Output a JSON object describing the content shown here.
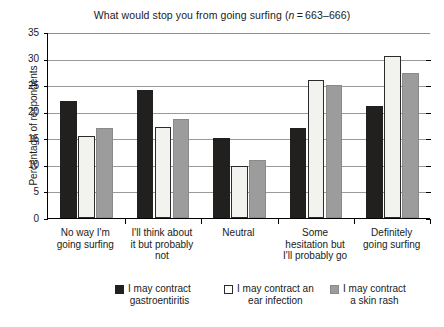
{
  "chart_data": {
    "type": "bar",
    "title_plain": "What would stop you from going surfing (n=663–666)",
    "title_prefix": "What would stop you from going surfing (",
    "title_italic": "n",
    "title_suffix": " = 663–666)",
    "xlabel": "",
    "ylabel": "Percentage of respondents",
    "ylim": [
      0,
      35
    ],
    "ytick_step": 5,
    "yticks": [
      0,
      5,
      10,
      15,
      20,
      25,
      30,
      35
    ],
    "ytick_labels": [
      "0",
      "5",
      "10",
      "15",
      "20",
      "25",
      "30",
      "35"
    ],
    "grid": true,
    "grid_axis": "y",
    "legend_position": "bottom",
    "categories": [
      "No way I'm going surfing",
      "I'll think about it but probably not",
      "Neutral",
      "Some hesitation but I'll probably go",
      "Definitely going surfing"
    ],
    "category_lines": [
      [
        "No way I'm",
        "going surfing"
      ],
      [
        "I'll think about",
        "it but probably",
        "not"
      ],
      [
        "Neutral"
      ],
      [
        "Some",
        "hesitation but",
        "I'll probably go"
      ],
      [
        "Definitely",
        "going surfing"
      ]
    ],
    "series": [
      {
        "name": "I may contract gastroentiritis",
        "name_lines": [
          "I may contract",
          "gastroentiritis"
        ],
        "color": "#221f1f",
        "swatch": "black",
        "values": [
          22,
          24,
          15,
          17,
          21
        ]
      },
      {
        "name": "I may contract an ear infection",
        "name_lines": [
          "I may contract an",
          "ear infection"
        ],
        "color": "#ffffff",
        "swatch": "white",
        "values": [
          15.5,
          17.2,
          9.8,
          26,
          30.4
        ]
      },
      {
        "name": "I may contract a skin rash",
        "name_lines": [
          "I may contract",
          "a skin rash"
        ],
        "color": "#9c9c9c",
        "swatch": "gray",
        "values": [
          17,
          18.7,
          11,
          25,
          27.2
        ]
      }
    ]
  },
  "figure": {
    "caption_remnant": ""
  }
}
